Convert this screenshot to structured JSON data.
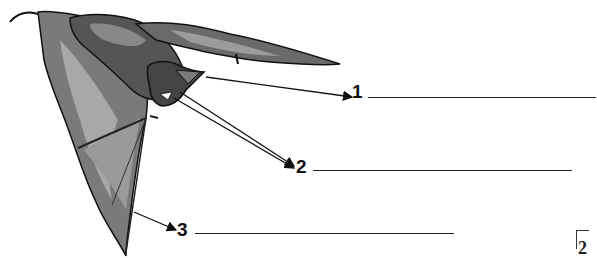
{
  "diagram": {
    "labels": [
      {
        "number": "1",
        "points_to": "ear"
      },
      {
        "number": "2",
        "points_to": "mouth / teeth"
      },
      {
        "number": "3",
        "points_to": "wing membrane"
      }
    ],
    "corner_mark": "2"
  },
  "colors": {
    "ink": "#111111",
    "mid_gray": "#6e6e6e",
    "light_gray": "#a8a8a8",
    "background": "#ffffff"
  }
}
